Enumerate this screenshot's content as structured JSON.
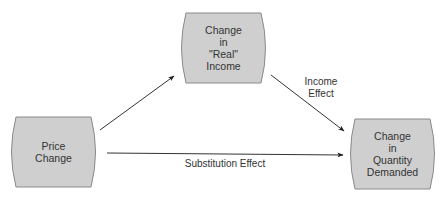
{
  "diagram": {
    "nodes": [
      {
        "id": "price",
        "label": "Price\nChange"
      },
      {
        "id": "income",
        "label": "Change\nin\n\"Real\"\nIncome"
      },
      {
        "id": "quantity",
        "label": "Change\nin\nQuantity\nDemanded"
      }
    ],
    "edges": [
      {
        "from": "price",
        "to": "income",
        "label": ""
      },
      {
        "from": "income",
        "to": "quantity",
        "label": "Income\nEffect"
      },
      {
        "from": "price",
        "to": "quantity",
        "label": "Substitution Effect"
      }
    ],
    "colors": {
      "node_fill": "#cfcfcf",
      "node_stroke": "#8a8a8a",
      "arrow": "#222222"
    }
  }
}
